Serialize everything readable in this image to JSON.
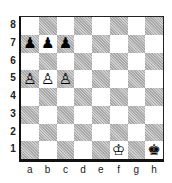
{
  "board": {
    "files": [
      "a",
      "b",
      "c",
      "d",
      "e",
      "f",
      "g",
      "h"
    ],
    "ranks": [
      "8",
      "7",
      "6",
      "5",
      "4",
      "3",
      "2",
      "1"
    ],
    "colors": {
      "light": "#ffffff",
      "dark": "#bdbdbd",
      "border": "#111111"
    },
    "pieces": [
      {
        "square": "a7",
        "color": "black",
        "type": "pawn",
        "glyph": "♟"
      },
      {
        "square": "b7",
        "color": "black",
        "type": "pawn",
        "glyph": "♟"
      },
      {
        "square": "c7",
        "color": "black",
        "type": "pawn",
        "glyph": "♟"
      },
      {
        "square": "a5",
        "color": "white",
        "type": "pawn",
        "glyph": "♙"
      },
      {
        "square": "b5",
        "color": "white",
        "type": "pawn",
        "glyph": "♙"
      },
      {
        "square": "c5",
        "color": "white",
        "type": "pawn",
        "glyph": "♙"
      },
      {
        "square": "f1",
        "color": "white",
        "type": "king",
        "glyph": "♔"
      },
      {
        "square": "h1",
        "color": "black",
        "type": "king",
        "glyph": "♚"
      }
    ]
  }
}
